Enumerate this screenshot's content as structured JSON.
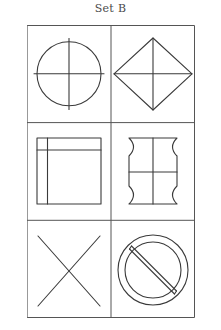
{
  "panel": {
    "title": "Set B",
    "title_icon": "none"
  },
  "style": {
    "background_color": "#ffffff",
    "stroke_color": "#3a3a3a",
    "title_color": "#4a4a4a",
    "grid_stroke_color": "#555555",
    "stroke_width": 1.1,
    "grid_stroke_width": 1
  },
  "grid": {
    "columns": 2,
    "rows": 3,
    "x": 27,
    "y": 25,
    "width": 168,
    "height": 293,
    "column_divider_x": 84,
    "row_divider_y": [
      97.6,
      195.3
    ]
  },
  "cells": [
    {
      "index": 1,
      "row": 1,
      "column": 1,
      "name": "circle-with-cross",
      "description": "Circle bisected by a vertical and a horizontal line that extend slightly past the circle",
      "shapes": [
        "circle",
        "vertical-line",
        "horizontal-line"
      ]
    },
    {
      "index": 2,
      "row": 1,
      "column": 2,
      "name": "diamond-with-cross",
      "description": "Diamond (square rotated 45 degrees) with vertical and horizontal lines joining opposite vertices",
      "shapes": [
        "diamond",
        "vertical-line",
        "horizontal-line"
      ]
    },
    {
      "index": 3,
      "row": 2,
      "column": 1,
      "name": "square-with-offset-lines",
      "description": "Square with a vertical line near the left edge and a horizontal line near the top edge",
      "shapes": [
        "square",
        "vertical-line",
        "horizontal-line"
      ]
    },
    {
      "index": 4,
      "row": 2,
      "column": 2,
      "name": "concave-corner-square-with-cross",
      "description": "Square with inward-curved (concave) corners, divided by a vertical and a horizontal line",
      "shapes": [
        "concave-square",
        "vertical-line",
        "horizontal-line"
      ]
    },
    {
      "index": 5,
      "row": 3,
      "column": 1,
      "name": "x-cross",
      "description": "Two long diagonal lines forming a large X",
      "shapes": [
        "diagonal-line",
        "diagonal-line"
      ]
    },
    {
      "index": 6,
      "row": 3,
      "column": 2,
      "name": "prohibition-sign",
      "description": "Double concentric circle with a thick diagonal bar from upper-left to lower-right",
      "shapes": [
        "circle",
        "circle",
        "diagonal-bar"
      ]
    }
  ]
}
